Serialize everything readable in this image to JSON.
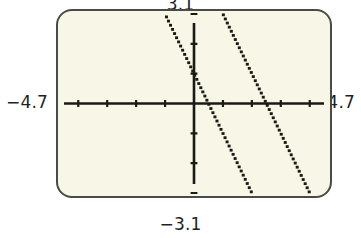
{
  "figure": {
    "kind": "graphing-calculator-screen",
    "screen_bg_color": "#f7f6e7",
    "screen_border_color": "#4a4a46",
    "ink_color": "#1a1a16",
    "page_bg_color": "#ffffff"
  },
  "window_labels": {
    "ymax": "3.1",
    "ymin": "−3.1",
    "xmin": "−4.7",
    "xmax": "4.7"
  },
  "chart_data": {
    "type": "line",
    "title": "",
    "subtitle": "",
    "xlabel": "",
    "ylabel": "",
    "xlim": [
      -4.7,
      4.7
    ],
    "ylim": [
      -3.1,
      3.1
    ],
    "grid": false,
    "legend": null,
    "axes": {
      "x_axis_visible": true,
      "y_axis_visible": true,
      "x_tick_step": 1,
      "y_tick_step": 1,
      "x_ticks": [
        -4,
        -3,
        -2,
        -1,
        1,
        2,
        3,
        4
      ],
      "y_ticks": [
        -3,
        -2,
        -1,
        1,
        2,
        3
      ],
      "tick_labels_shown": false
    },
    "render_style": "dotted-pixel-trace",
    "series": [
      {
        "name": "line-1",
        "style": "dotted",
        "slope": -2,
        "intercept": 1,
        "equation": "y = -2x + 1",
        "x_intercept": 0.5,
        "y_intercept": 1,
        "x": [
          -1.3,
          -1.0,
          -0.5,
          0.0,
          0.5,
          1.0,
          1.5,
          2.05
        ],
        "y": [
          3.6,
          3.0,
          2.0,
          1.0,
          0.0,
          -1.0,
          -2.0,
          -3.1
        ]
      },
      {
        "name": "line-2",
        "style": "dotted",
        "slope": -2,
        "intercept": 5,
        "equation": "y = -2x + 5",
        "x_intercept": 2.5,
        "y_intercept": 5,
        "x": [
          0.6,
          1.0,
          1.5,
          2.0,
          2.5,
          3.0,
          3.5,
          4.05
        ],
        "y": [
          3.8,
          3.0,
          2.0,
          1.0,
          0.0,
          -1.0,
          -2.0,
          -3.1
        ]
      }
    ],
    "annotations": [
      {
        "text": "3.1",
        "position": "above-screen-center"
      },
      {
        "text": "−3.1",
        "position": "below-screen-center"
      },
      {
        "text": "−4.7",
        "position": "left-of-screen"
      },
      {
        "text": "4.7",
        "position": "right-of-screen"
      }
    ]
  }
}
